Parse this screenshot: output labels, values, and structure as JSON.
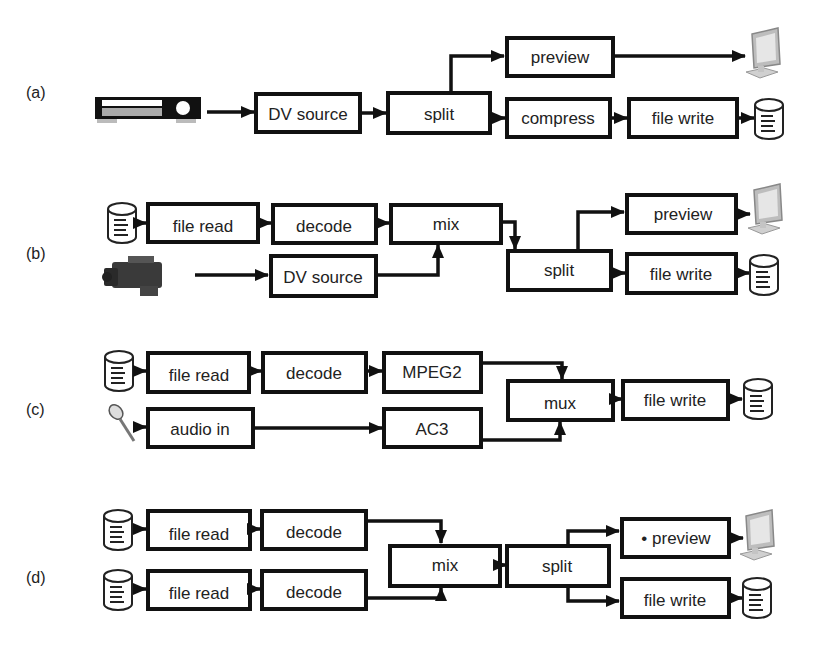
{
  "diagram": {
    "type": "media processing pipelines",
    "panels": [
      {
        "label": "(a)",
        "nodes": [
          "DV source",
          "split",
          "preview",
          "compress",
          "file write"
        ],
        "inputs": [
          "vcr-icon"
        ],
        "outputs": [
          "monitor-icon",
          "disk-icon"
        ],
        "edges": [
          [
            "vcr",
            "DV source"
          ],
          [
            "DV source",
            "split"
          ],
          [
            "split",
            "preview"
          ],
          [
            "split",
            "compress"
          ],
          [
            "compress",
            "file write"
          ],
          [
            "preview",
            "monitor"
          ],
          [
            "file write",
            "disk"
          ]
        ]
      },
      {
        "label": "(b)",
        "nodes": [
          "file read",
          "decode",
          "mix",
          "DV source",
          "split",
          "preview",
          "file write"
        ],
        "inputs": [
          "disk-icon",
          "camcorder-icon"
        ],
        "outputs": [
          "monitor-icon",
          "disk-icon"
        ],
        "edges": [
          [
            "disk",
            "file read"
          ],
          [
            "file read",
            "decode"
          ],
          [
            "decode",
            "mix"
          ],
          [
            "camcorder",
            "DV source"
          ],
          [
            "DV source",
            "mix"
          ],
          [
            "mix",
            "split"
          ],
          [
            "split",
            "preview"
          ],
          [
            "split",
            "file write"
          ],
          [
            "preview",
            "monitor"
          ],
          [
            "file write",
            "disk"
          ]
        ]
      },
      {
        "label": "(c)",
        "nodes": [
          "file read",
          "decode",
          "MPEG2",
          "audio in",
          "AC3",
          "mux",
          "file write"
        ],
        "inputs": [
          "disk-icon",
          "microphone-icon"
        ],
        "outputs": [
          "disk-icon"
        ],
        "edges": [
          [
            "disk",
            "file read"
          ],
          [
            "file read",
            "decode"
          ],
          [
            "decode",
            "MPEG2"
          ],
          [
            "microphone",
            "audio in"
          ],
          [
            "audio in",
            "AC3"
          ],
          [
            "MPEG2",
            "mux"
          ],
          [
            "AC3",
            "mux"
          ],
          [
            "mux",
            "file write"
          ],
          [
            "file write",
            "disk"
          ]
        ]
      },
      {
        "label": "(d)",
        "nodes": [
          "file read",
          "decode",
          "file read",
          "decode",
          "mix",
          "split",
          "preview",
          "file write"
        ],
        "inputs": [
          "disk-icon",
          "disk-icon"
        ],
        "outputs": [
          "monitor-icon",
          "disk-icon"
        ],
        "edges": [
          [
            "disk",
            "file read"
          ],
          [
            "file read",
            "decode"
          ],
          [
            "decode",
            "mix"
          ],
          [
            "disk2",
            "file read2"
          ],
          [
            "file read2",
            "decode2"
          ],
          [
            "decode2",
            "mix"
          ],
          [
            "mix",
            "split"
          ],
          [
            "split",
            "preview"
          ],
          [
            "split",
            "file write"
          ],
          [
            "preview",
            "monitor"
          ],
          [
            "file write",
            "disk"
          ]
        ]
      }
    ]
  },
  "labels": {
    "a": "(a)",
    "b": "(b)",
    "c": "(c)",
    "d": "(d)"
  },
  "a": {
    "dv_source": "DV source",
    "split": "split",
    "preview": "preview",
    "compress": "compress",
    "file_write": "file write"
  },
  "b": {
    "file_read": "file read",
    "decode": "decode",
    "mix": "mix",
    "dv_source": "DV source",
    "split": "split",
    "preview": "preview",
    "file_write": "file write"
  },
  "c": {
    "file_read": "file read",
    "decode": "decode",
    "mpeg2": "MPEG2",
    "audio_in": "audio in",
    "ac3": "AC3",
    "mux": "mux",
    "file_write": "file write"
  },
  "d": {
    "file_read_1": "file read",
    "decode_1": "decode",
    "file_read_2": "file read",
    "decode_2": "decode",
    "mix": "mix",
    "split": "split",
    "preview": "• preview",
    "file_write": "file write"
  },
  "colors": {
    "stroke": "#111111",
    "text": "#222222",
    "background": "#ffffff"
  }
}
